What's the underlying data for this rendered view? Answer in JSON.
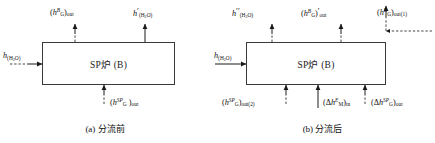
{
  "figure": {
    "box_label": "SP炉 (B)",
    "panels": [
      {
        "id": "a",
        "caption": "(a) 分流前",
        "labels": {
          "top_left": "(h_G^B)_out",
          "top_right": "h'_(H2O)",
          "inlet_left": "h_(H2O)",
          "bottom_center": "(h_G^SP)_out"
        }
      },
      {
        "id": "b",
        "caption": "(b) 分流后",
        "labels": {
          "top_left": "h''_(H2O)",
          "top_center": "(h_G^B)'_out",
          "top_right": "(h_G^B)_out(1)",
          "inlet_left": "h_(H2O)",
          "bottom_left": "(h_G^SP)_out(2)",
          "bottom_center": "(Δh_M^E)_in",
          "bottom_right": "(Δh_G^SP)_out"
        }
      }
    ]
  },
  "style": {
    "line_color": "#3a3a3a",
    "text_color": "#111111",
    "background": "#ffffff"
  }
}
